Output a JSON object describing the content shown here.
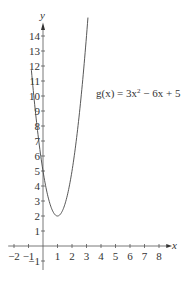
{
  "chart_data": {
    "type": "line",
    "title": "",
    "xlabel": "x",
    "ylabel": "y",
    "xlim": [
      -2,
      8
    ],
    "ylim": [
      -1,
      14
    ],
    "x_ticks": [
      -2,
      -1,
      1,
      2,
      3,
      4,
      5,
      6,
      7,
      8
    ],
    "y_ticks": [
      -1,
      1,
      2,
      3,
      4,
      5,
      6,
      7,
      8,
      9,
      10,
      11,
      12,
      13,
      14
    ],
    "grid": false,
    "legend": null,
    "annotations": [
      {
        "text": "g(x) = 3x² − 6x + 5",
        "x": 5.8,
        "y": 10.3
      }
    ],
    "series": [
      {
        "name": "g(x) = 3x^2 - 6x + 5",
        "function": "3x^2 - 6x + 5",
        "x": [
          -0.8,
          -0.5,
          0,
          0.5,
          1,
          1.5,
          2,
          2.5,
          3,
          3.1
        ],
        "values": [
          11.72,
          9.75,
          5,
          2.75,
          2,
          2.75,
          5,
          8.75,
          14,
          15.23
        ]
      }
    ],
    "vertex": {
      "x": 1,
      "y": 2
    }
  },
  "labels": {
    "x_axis": "x",
    "y_axis": "y",
    "equation_prefix": "g(x) = 3x",
    "equation_exp": "2",
    "equation_suffix": " − 6x + 5"
  }
}
